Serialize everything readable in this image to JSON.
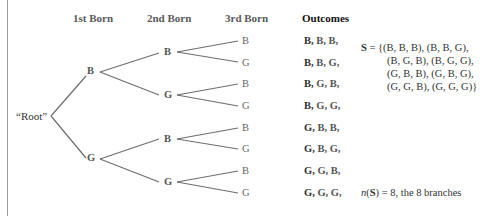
{
  "headers": {
    "first": "1st Born",
    "second": "2nd Born",
    "third": "3rd Born",
    "outcomes": "Outcomes"
  },
  "root": {
    "label": "“Root”"
  },
  "level1": [
    {
      "label": "B"
    },
    {
      "label": "G"
    }
  ],
  "level2": [
    {
      "label": "B"
    },
    {
      "label": "G"
    },
    {
      "label": "B"
    },
    {
      "label": "G"
    }
  ],
  "level3": [
    {
      "label": "B"
    },
    {
      "label": "G"
    },
    {
      "label": "B"
    },
    {
      "label": "G"
    },
    {
      "label": "B"
    },
    {
      "label": "G"
    },
    {
      "label": "B"
    },
    {
      "label": "G"
    }
  ],
  "outcomes": [
    {
      "first": "B,",
      "rest": " B,  B,"
    },
    {
      "first": "B,",
      "rest": " B,  G,"
    },
    {
      "first": "B,",
      "rest": " G,  B,"
    },
    {
      "first": "B,",
      "rest": " G,  G,"
    },
    {
      "first": "G,",
      "rest": " B,  B,"
    },
    {
      "first": "G,",
      "rest": " B,  G,"
    },
    {
      "first": "G,",
      "rest": " G,  B,"
    },
    {
      "first": "G,",
      "rest": " G,  G,"
    }
  ],
  "sample_space": {
    "symbol": "S",
    "equals": " = {",
    "lines": [
      "(B, B, B), (B, B, G),",
      "(B, G, B), (B, G, G),",
      "(G, B, B), (G, B, G),",
      "(G, G, B), (G, G, G)}"
    ]
  },
  "count": {
    "fn": "n",
    "open": "(",
    "symbol": "S",
    "close": ") =  8, the 8 branches"
  },
  "colors": {
    "line": "#6e6e6e",
    "text": "#555555",
    "heading": "#111111"
  }
}
